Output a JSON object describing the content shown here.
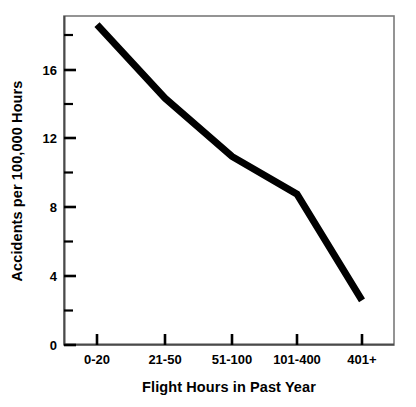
{
  "chart_data": {
    "type": "line",
    "title": "",
    "subtitle": "",
    "xlabel": "Flight Hours in Past Year",
    "ylabel": "Accidents per 100,000 Hours",
    "categories": [
      "0-20",
      "21-50",
      "51-100",
      "101-400",
      "401+"
    ],
    "values": [
      18.7,
      14.4,
      11.0,
      8.8,
      2.6
    ],
    "series": [
      {
        "name": "Accidents per 100,000 Hours",
        "values": [
          18.7,
          14.4,
          11.0,
          8.8,
          2.6
        ],
        "color": "#000000"
      }
    ],
    "ylim": [
      0,
      19.2
    ],
    "xlim": [
      0,
      6
    ],
    "y_major_ticks": [
      0,
      4,
      8,
      12,
      16
    ],
    "y_minor_ticks": [
      2,
      6,
      10,
      14,
      18
    ],
    "y_tick_labels": [
      "0",
      "4",
      "8",
      "12",
      "16"
    ],
    "x_tick_labels": [
      "0-20",
      "21-50",
      "51-100",
      "101-400",
      "401+"
    ],
    "grid": false,
    "legend": false,
    "legend_position": "none",
    "line_width": 7,
    "frame": true,
    "frame_color": "#7a7a7a",
    "background_color": "#ffffff",
    "annotations": []
  },
  "axis": {
    "y_labels": {
      "t0": "0",
      "t4": "4",
      "t8": "8",
      "t12": "12",
      "t16": "16"
    },
    "x_labels": {
      "c0": "0-20",
      "c1": "21-50",
      "c2": "51-100",
      "c3": "101-400",
      "c4": "401+"
    },
    "x_title": "Flight Hours in Past Year",
    "y_title": "Accidents per 100,000 Hours"
  }
}
